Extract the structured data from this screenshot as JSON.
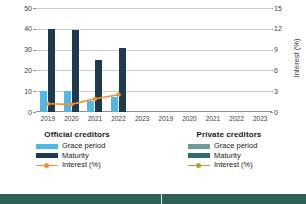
{
  "chart_data": {
    "type": "bar",
    "title": "",
    "categories": [
      "2019",
      "2020",
      "2021",
      "2022",
      "2023"
    ],
    "xlabel": "",
    "panels": [
      {
        "name": "Official creditors",
        "ylabel_left": "Years",
        "ylabel_right": "Interest (%)",
        "ylim": [
          0,
          50
        ],
        "ylim_right": [
          0,
          15
        ],
        "yticks": [
          0,
          10,
          20,
          30,
          40,
          50
        ],
        "yticks_right": [
          0,
          3,
          6,
          9,
          12,
          15
        ],
        "series": [
          {
            "name": "Grace period",
            "type": "bar",
            "axis": "left",
            "color": "#4EB9E6",
            "values": [
              10,
              10,
              5.5,
              7,
              null
            ]
          },
          {
            "name": "Maturity",
            "type": "bar",
            "axis": "left",
            "color": "#1F3A4D",
            "values": [
              40,
              39.5,
              25,
              31,
              null
            ]
          },
          {
            "name": "Interest (%)",
            "type": "line",
            "axis": "right",
            "color": "#F2912E",
            "values": [
              1.2,
              1.1,
              1.9,
              2.5,
              null
            ]
          }
        ]
      },
      {
        "name": "Private creditors",
        "ylabel_left": "Years",
        "ylabel_right": "Interest (%)",
        "ylim": [
          0,
          50
        ],
        "ylim_right": [
          0,
          15
        ],
        "yticks": [
          0,
          10,
          20,
          30,
          40,
          50
        ],
        "yticks_right": [
          0,
          3,
          6,
          9,
          12,
          15
        ],
        "series": [
          {
            "name": "Grace period",
            "type": "bar",
            "axis": "left",
            "color": "#6E9B98",
            "values": [
              null,
              null,
              null,
              null,
              null
            ]
          },
          {
            "name": "Maturity",
            "type": "bar",
            "axis": "left",
            "color": "#2E6B6B",
            "values": [
              null,
              null,
              null,
              null,
              null
            ]
          },
          {
            "name": "Interest (%)",
            "type": "line",
            "axis": "right",
            "color": "#B99A33",
            "values": [
              null,
              null,
              null,
              null,
              null
            ]
          }
        ]
      }
    ],
    "grid": true,
    "legend_position": "bottom"
  },
  "axes": {
    "left_title": "Years",
    "right_title": "Interest (%)",
    "left_ticks": [
      "50",
      "40",
      "30",
      "20",
      "10",
      "0"
    ],
    "right_ticks": [
      "15",
      "12",
      "9",
      "6",
      "3",
      "0"
    ],
    "x_ticks": [
      "2019",
      "2020",
      "2021",
      "2022",
      "2023"
    ]
  },
  "legends": [
    {
      "title": "Official creditors",
      "items": [
        {
          "label": "Grace period",
          "color": "#4EB9E6",
          "kind": "swatch"
        },
        {
          "label": "Maturity",
          "color": "#1F3A4D",
          "kind": "swatch"
        },
        {
          "label": "Interest (%)",
          "color": "#F2912E",
          "kind": "line"
        }
      ]
    },
    {
      "title": "Private creditors",
      "items": [
        {
          "label": "Grace period",
          "color": "#6E9B98",
          "kind": "swatch"
        },
        {
          "label": "Maturity",
          "color": "#2E6B6B",
          "kind": "swatch"
        },
        {
          "label": "Interest (%)",
          "color": "#B99A33",
          "kind": "line"
        }
      ]
    }
  ],
  "colors": {
    "grid": "#c9ccd1",
    "axis": "#8c9096",
    "text": "#3d3d3d",
    "bottom_strip": "#2D6059"
  }
}
